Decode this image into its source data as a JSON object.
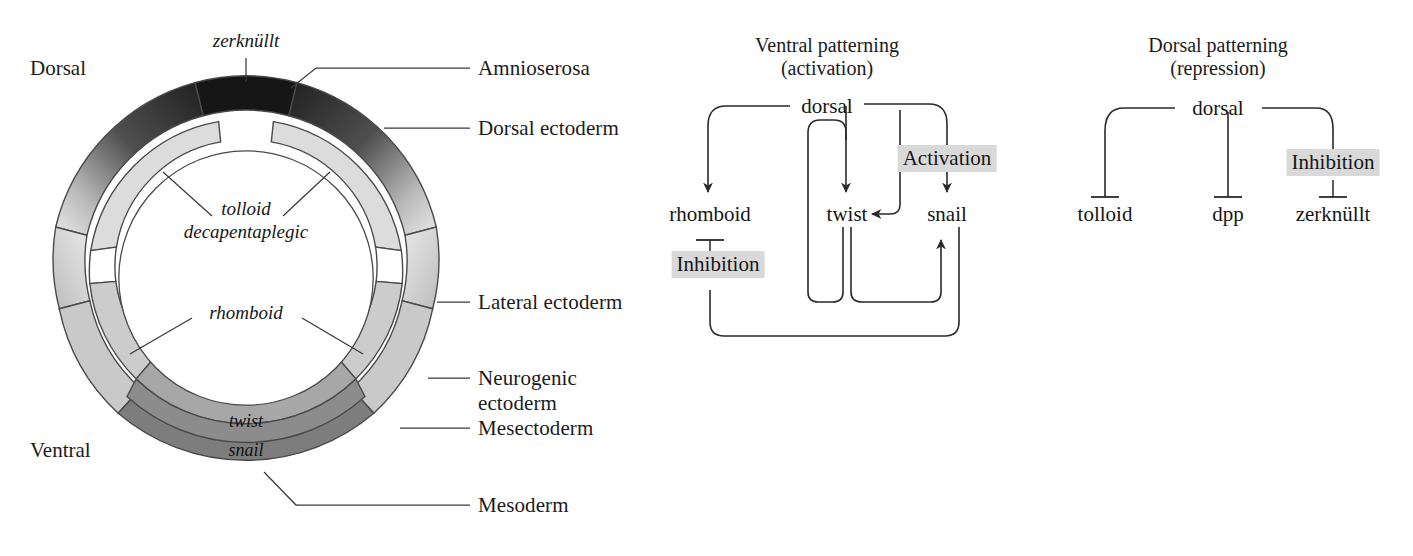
{
  "figure": {
    "type": "diagram"
  },
  "embryo": {
    "orientation": {
      "dorsal": "Dorsal",
      "ventral": "Ventral"
    },
    "callouts": [
      {
        "id": "amnioserosa",
        "label": "Amnioserosa"
      },
      {
        "id": "dorsal-ectoderm",
        "label": "Dorsal ectoderm"
      },
      {
        "id": "lateral-ectoderm",
        "label": "Lateral ectoderm"
      },
      {
        "id": "neurogenic-ectoderm",
        "label": "Neurogenic",
        "label2": "ectoderm"
      },
      {
        "id": "mesectoderm",
        "label": "Mesectoderm"
      },
      {
        "id": "mesoderm",
        "label": "Mesoderm"
      }
    ],
    "genes": {
      "zerknullt": "zerknüllt",
      "tolloid": "tolloid",
      "decapentaplegic": "decapentaplegic",
      "rhomboid": "rhomboid",
      "twist": "twist",
      "snail": "snail"
    },
    "ring_colors": {
      "amnioserosa": "#1a1a1a",
      "dorsal_ectoderm_dark": "#242424",
      "dorsal_ectoderm_mid": "#6e6e6e",
      "lateral_ectoderm": "#d5d5d5",
      "neurogenic_ectoderm": "#c2c2c2",
      "mesectoderm": "#9a9a9a",
      "mesoderm": "#7f7f7f",
      "inner_zkn_band": "#d8d8d8",
      "background": "#ffffff",
      "stroke": "#4a4a4a"
    }
  },
  "ventral_panel": {
    "title_line1": "Ventral patterning",
    "title_line2": "(activation)",
    "nodes": {
      "dorsal": "dorsal",
      "rhomboid": "rhomboid",
      "twist": "twist",
      "snail": "snail"
    },
    "tags": {
      "activation": "Activation",
      "inhibition": "Inhibition"
    },
    "edges": [
      {
        "from": "dorsal",
        "to": "rhomboid",
        "kind": "activation"
      },
      {
        "from": "dorsal",
        "to": "twist",
        "kind": "activation"
      },
      {
        "from": "dorsal",
        "to": "snail",
        "kind": "activation"
      },
      {
        "from": "snail",
        "to": "twist",
        "kind": "activation"
      },
      {
        "from": "twist",
        "to": "snail",
        "kind": "activation"
      },
      {
        "from": "snail",
        "to": "rhomboid",
        "kind": "inhibition"
      }
    ]
  },
  "dorsal_panel": {
    "title_line1": "Dorsal patterning",
    "title_line2": "(repression)",
    "nodes": {
      "dorsal": "dorsal",
      "tolloid": "tolloid",
      "dpp": "dpp",
      "zerknullt": "zerknüllt"
    },
    "tags": {
      "inhibition": "Inhibition"
    },
    "edges": [
      {
        "from": "dorsal",
        "to": "tolloid",
        "kind": "inhibition"
      },
      {
        "from": "dorsal",
        "to": "dpp",
        "kind": "inhibition"
      },
      {
        "from": "dorsal",
        "to": "zerknullt",
        "kind": "inhibition"
      }
    ]
  }
}
